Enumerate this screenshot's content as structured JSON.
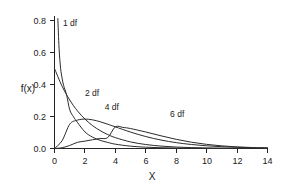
{
  "chart_data": {
    "type": "line",
    "title": "",
    "xlabel": "X",
    "ylabel": "f(x)",
    "xlim": [
      0,
      14
    ],
    "ylim": [
      0.0,
      0.85
    ],
    "grid": false,
    "legend_position": "inline-annotations",
    "x_ticks": [
      "0",
      "2",
      "4",
      "6",
      "8",
      "10",
      "12",
      "14"
    ],
    "x_tick_values": [
      0,
      2,
      4,
      6,
      8,
      10,
      12,
      14
    ],
    "y_ticks": [
      "0.0",
      "0.2",
      "0.4",
      "0.6",
      "0.8"
    ],
    "y_tick_values": [
      0.0,
      0.2,
      0.4,
      0.6,
      0.8
    ],
    "baseline": {
      "y": 0.0,
      "style": "dashed",
      "x_from": 0,
      "x_to": 14
    },
    "annotations": [
      {
        "text": "1 df",
        "x": 0.55,
        "y": 0.765
      },
      {
        "text": "2 df",
        "x": 2.0,
        "y": 0.33
      },
      {
        "text": "4 df",
        "x": 3.3,
        "y": 0.24
      },
      {
        "text": "6 df",
        "x": 7.6,
        "y": 0.2
      }
    ],
    "series": [
      {
        "name": "1 df",
        "label": "1 df",
        "df": 1,
        "x": [
          0.22,
          0.3,
          0.4,
          0.5,
          0.6,
          0.8,
          1.0,
          1.25,
          1.5,
          2.0,
          2.5,
          3.0,
          3.5,
          4.0,
          5.0,
          6.0,
          7.0,
          8.0,
          9.0,
          10.0,
          11.0,
          12.0,
          13.0,
          14.0
        ],
        "y": [
          0.812,
          0.627,
          0.502,
          0.439,
          0.394,
          0.333,
          0.242,
          0.198,
          0.164,
          0.104,
          0.071,
          0.051,
          0.038,
          0.027,
          0.0146,
          0.0081,
          0.0046,
          0.0027,
          0.0016,
          0.0009,
          0.0006,
          0.0004,
          0.0002,
          0.0002
        ]
      },
      {
        "name": "2 df",
        "label": "2 df",
        "df": 2,
        "x": [
          0.0,
          0.5,
          1.0,
          1.5,
          2.0,
          2.5,
          3.0,
          3.5,
          4.0,
          5.0,
          6.0,
          7.0,
          8.0,
          9.0,
          10.0,
          11.0,
          12.0,
          13.0,
          14.0
        ],
        "y": [
          0.5,
          0.389,
          0.303,
          0.236,
          0.184,
          0.143,
          0.112,
          0.087,
          0.068,
          0.041,
          0.025,
          0.015,
          0.009,
          0.0056,
          0.0034,
          0.002,
          0.0012,
          0.0008,
          0.0005
        ]
      },
      {
        "name": "4 df",
        "label": "4 df",
        "df": 4,
        "x": [
          0.0,
          0.5,
          1.0,
          1.5,
          2.0,
          2.5,
          3.0,
          3.5,
          4.0,
          5.0,
          6.0,
          7.0,
          8.0,
          9.0,
          10.0,
          11.0,
          12.0,
          13.0,
          14.0
        ],
        "y": [
          0.0,
          0.0487,
          0.1516,
          0.1772,
          0.1839,
          0.1791,
          0.1673,
          0.1516,
          0.1353,
          0.1026,
          0.0747,
          0.0529,
          0.0366,
          0.025,
          0.0168,
          0.0112,
          0.0074,
          0.0048,
          0.0032
        ]
      },
      {
        "name": "6 df",
        "label": "6 df",
        "df": 6,
        "x": [
          0.0,
          0.5,
          1.0,
          1.5,
          2.0,
          2.5,
          3.0,
          3.5,
          4.0,
          4.5,
          5.0,
          6.0,
          7.0,
          8.0,
          9.0,
          10.0,
          11.0,
          12.0,
          13.0,
          14.0
        ],
        "y": [
          0.0,
          0.0049,
          0.0189,
          0.0383,
          0.046,
          0.0548,
          0.0627,
          0.0681,
          0.1353,
          0.1317,
          0.1247,
          0.1031,
          0.0794,
          0.0573,
          0.0393,
          0.0258,
          0.0163,
          0.01,
          0.006,
          0.0035
        ]
      }
    ]
  },
  "axis": {
    "x_title": "X",
    "y_title": "f(x)"
  }
}
